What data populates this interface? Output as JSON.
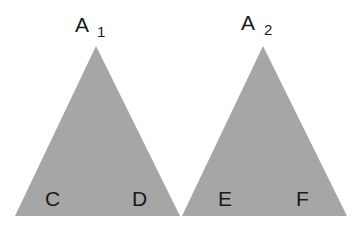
{
  "diagram": {
    "fill_color": "#a6a6a6",
    "trees": [
      {
        "root_label": "A",
        "root_subscript": "1",
        "leaves": [
          "C",
          "D"
        ]
      },
      {
        "root_label": "A",
        "root_subscript": "2",
        "leaves": [
          "E",
          "F"
        ]
      }
    ]
  }
}
